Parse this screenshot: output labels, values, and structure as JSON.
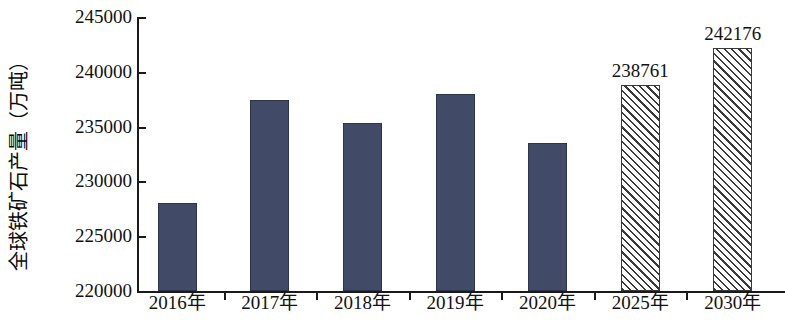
{
  "chart_data": {
    "type": "bar",
    "title": "",
    "xlabel": "",
    "ylabel": "全球铁矿石产量（万吨）",
    "categories": [
      "2016年",
      "2017年",
      "2018年",
      "2019年",
      "2020年",
      "2025年",
      "2030年"
    ],
    "values": [
      228000,
      237400,
      235300,
      238000,
      233500,
      238761,
      242176
    ],
    "data_labels": [
      "",
      "",
      "",
      "",
      "",
      "238761",
      "242176"
    ],
    "series": [
      {
        "name": "全球铁矿石产量",
        "values": [
          228000,
          237400,
          235300,
          238000,
          233500,
          238761,
          242176
        ],
        "styles": [
          "solid",
          "solid",
          "solid",
          "solid",
          "solid",
          "hatched",
          "hatched"
        ]
      }
    ],
    "ylim": [
      220000,
      245000
    ],
    "ytick_values": [
      245000,
      240000,
      235000,
      230000,
      225000,
      220000
    ],
    "ytick_labels": [
      "245000",
      "240000",
      "235000",
      "230000",
      "225000",
      "220000"
    ],
    "grid": false,
    "legend": null,
    "colors": {
      "bar_solid": "#414a66",
      "bar_solid_border": "#2e3548",
      "bar_hatch_line": "#3a3a3a",
      "bar_hatch_background": "#ffffff",
      "axis": "#1a1a1a",
      "text": "#111111",
      "background": "#ffffff"
    }
  }
}
